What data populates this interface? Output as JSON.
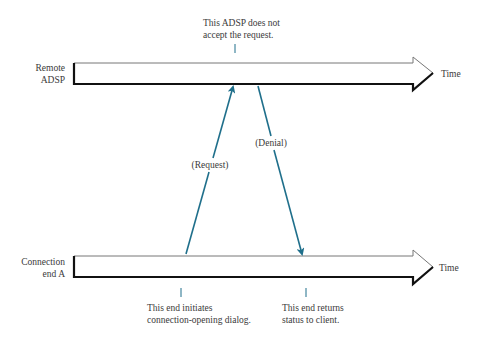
{
  "diagram": {
    "type": "sequence-timeline",
    "colors": {
      "message_arrow": "#1f6f8b",
      "timeline_outline": "#222222",
      "text": "#3a3a3a"
    },
    "timelines": [
      {
        "label_line1": "Remote",
        "label_line2": "ADSP",
        "axis_label": "Time"
      },
      {
        "label_line1": "Connection",
        "label_line2": "end A",
        "axis_label": "Time"
      }
    ],
    "messages": [
      {
        "label": "(Request)",
        "from": "Connection end A",
        "to": "Remote ADSP"
      },
      {
        "label": "(Denial)",
        "from": "Remote ADSP",
        "to": "Connection end A"
      }
    ],
    "annotations": {
      "top_line1": "This ADSP does not",
      "top_line2": "accept the request.",
      "bottom_left_line1": "This end initiates",
      "bottom_left_line2": "connection-opening dialog.",
      "bottom_right_line1": "This end returns",
      "bottom_right_line2": "status to client."
    }
  }
}
